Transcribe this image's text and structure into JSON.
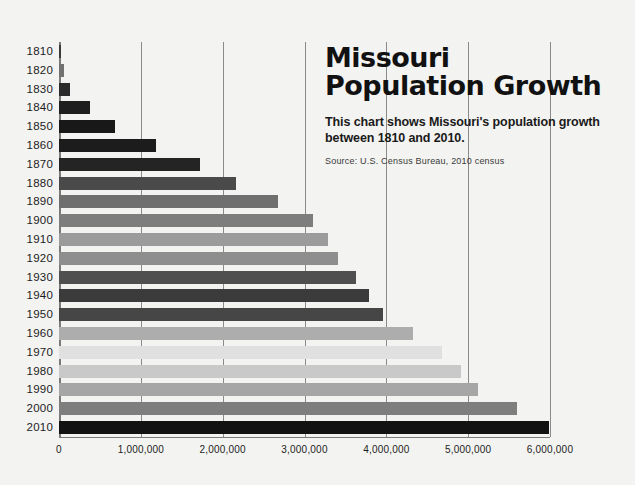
{
  "header": {
    "title_line1": "Missouri",
    "title_line2": "Population Growth",
    "subtitle": "This chart shows Missouri's population growth between 1810 and 2010.",
    "source": "Source: U.S. Census Bureau, 2010 census"
  },
  "chart_data": {
    "type": "bar",
    "orientation": "horizontal",
    "title": "Missouri Population Growth",
    "subtitle": "This chart shows Missouri's population growth between 1810 and 2010.",
    "source": "Source: U.S. Census Bureau, 2010 census",
    "xlabel": "",
    "ylabel": "",
    "xlim": [
      0,
      6000000
    ],
    "xticks": [
      0,
      1000000,
      2000000,
      3000000,
      4000000,
      5000000,
      6000000
    ],
    "xtick_labels": [
      "0",
      "1,000,000",
      "2,000,000",
      "3,000,000",
      "4,000,000",
      "5,000,000",
      "6,000,000"
    ],
    "grid": true,
    "legend": "none",
    "categories": [
      "1810",
      "1820",
      "1830",
      "1840",
      "1850",
      "1860",
      "1870",
      "1880",
      "1890",
      "1900",
      "1910",
      "1920",
      "1930",
      "1940",
      "1950",
      "1960",
      "1970",
      "1980",
      "1990",
      "2000",
      "2010"
    ],
    "values": [
      20000,
      66000,
      140000,
      384000,
      682000,
      1182000,
      1721000,
      2168000,
      2679000,
      3107000,
      3293000,
      3404000,
      3629000,
      3785000,
      3955000,
      4320000,
      4677000,
      4917000,
      5117000,
      5595000,
      5989000
    ],
    "bar_colors": [
      "#3a3a3a",
      "#717171",
      "#2b2b2b",
      "#1e1e1e",
      "#181818",
      "#1c1c1c",
      "#242424",
      "#4a4a4a",
      "#6f6f6f",
      "#7d7d7d",
      "#9b9b9b",
      "#8e8e8e",
      "#4f4f4f",
      "#3b3b3b",
      "#464646",
      "#adadad",
      "#e0e0e0",
      "#c9c9c9",
      "#a6a6a6",
      "#7e7e7e",
      "#121212"
    ]
  },
  "colors": {
    "background": "#f3f3f1",
    "axis": "#7a7a7a",
    "grid": "#8a8a8a",
    "text": "#1b1b1b"
  }
}
